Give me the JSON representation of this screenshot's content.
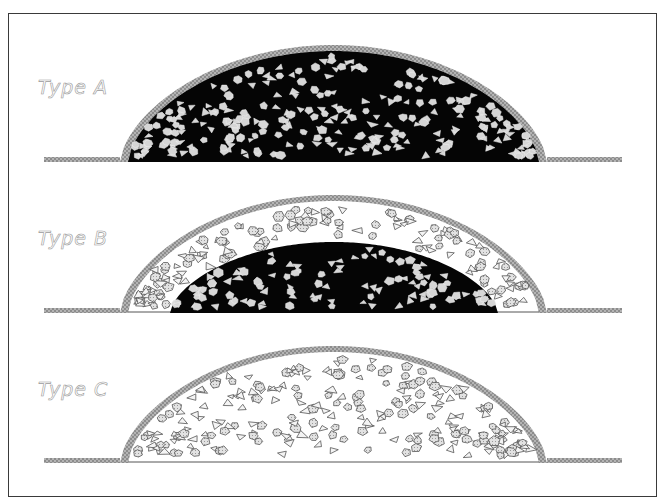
{
  "figure": {
    "colors": {
      "frame": "#3a3a3a",
      "crust": "#a8a8a8",
      "crust_dark": "#8a8a8a",
      "core": "#050505",
      "particle_on_dark": "#d6d6d6",
      "particle_outline": "#555555",
      "particle_fill_light": "#d2d2d2",
      "label": "#9a9a9a"
    },
    "panels": [
      {
        "label": "Type A",
        "label_pos": [
          38,
          96
        ],
        "ground_y": 161,
        "left_ground": [
          44,
          120
        ],
        "right_ground": [
          547,
          622
        ],
        "dome_top_y": 45,
        "crust_thickness": 6,
        "core": "full",
        "core_span": [
          120,
          547
        ],
        "core_top_y": 51,
        "particles_dark": 260,
        "particles_light": 0,
        "seed": 11
      },
      {
        "label": "Type B",
        "label_pos": [
          38,
          247
        ],
        "ground_y": 312,
        "left_ground": [
          44,
          120
        ],
        "right_ground": [
          547,
          622
        ],
        "dome_top_y": 195,
        "crust_thickness": 6,
        "core": "partial",
        "core_span": [
          170,
          498
        ],
        "core_top_y": 242,
        "particles_dark": 110,
        "particles_light": 150,
        "seed": 23
      },
      {
        "label": "Type C",
        "label_pos": [
          38,
          398
        ],
        "ground_y": 462,
        "left_ground": [
          44,
          120
        ],
        "right_ground": [
          547,
          622
        ],
        "dome_top_y": 346,
        "crust_thickness": 6,
        "core": "none",
        "core_span": [
          0,
          0
        ],
        "core_top_y": 0,
        "particles_dark": 0,
        "particles_light": 240,
        "seed": 37
      }
    ]
  }
}
